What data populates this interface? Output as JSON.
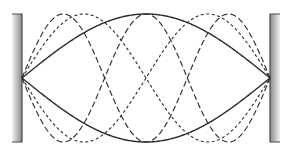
{
  "diagram": {
    "walls": [
      {
        "side": "left",
        "x": 12,
        "y": 14,
        "width": 10,
        "height": 128
      },
      {
        "side": "right",
        "x": 270,
        "y": 14,
        "width": 10,
        "height": 128
      }
    ],
    "string": {
      "x_start": 22,
      "x_end": 270,
      "center_y": 78,
      "amplitude": 64
    },
    "modes": [
      {
        "harmonic": 1,
        "style": "solid",
        "dash": "",
        "stroke_width": 1.4
      },
      {
        "harmonic": 2,
        "style": "short-dash",
        "dash": "3,2.5",
        "stroke_width": 1.1
      },
      {
        "harmonic": 3,
        "style": "long-dash",
        "dash": "6,3",
        "stroke_width": 1.1
      }
    ],
    "colors": {
      "line": "#2a2a2a",
      "wall_border": "#4a4a4a",
      "wall_dark": "#8a8a8a",
      "wall_light": "#f2f2f2"
    }
  }
}
